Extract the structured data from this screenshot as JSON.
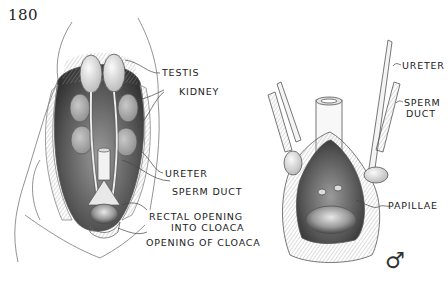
{
  "page": {
    "number": "180"
  },
  "left_figure": {
    "labels": [
      {
        "id": "testis",
        "text": "TESTIS"
      },
      {
        "id": "kidney",
        "text": "KIDNEY"
      },
      {
        "id": "ureter",
        "text": "URETER"
      },
      {
        "id": "sperm_duct",
        "text": "SPERM DUCT"
      },
      {
        "id": "rectal_opening_line1",
        "text": "RECTAL OPENING"
      },
      {
        "id": "rectal_opening_line2",
        "text": "INTO CLOACA"
      },
      {
        "id": "opening_of_cloaca",
        "text": "OPENING OF CLOACA"
      }
    ]
  },
  "right_figure": {
    "labels": [
      {
        "id": "ureter",
        "text": "URETER"
      },
      {
        "id": "sperm_line1",
        "text": "SPERM"
      },
      {
        "id": "sperm_line2",
        "text": "DUCT"
      },
      {
        "id": "papillae",
        "text": "PAPILLAE"
      }
    ],
    "sex_symbol": "♂"
  }
}
